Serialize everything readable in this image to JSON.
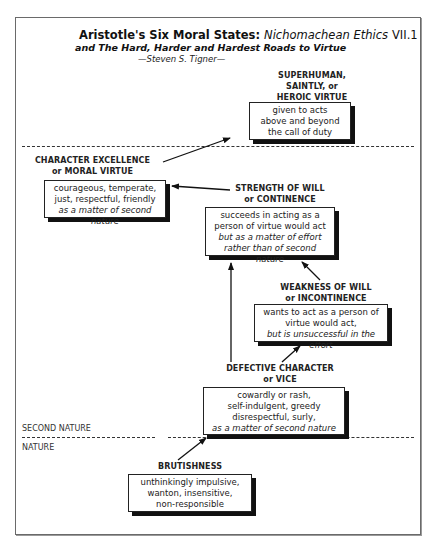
{
  "header": {
    "title_bold": "Aristotle's Six Moral States:",
    "title_italic": "Nichomachean Ethics",
    "title_ref": "VII.1",
    "subtitle": "and The Hard, Harder and Hardest Roads to Virtue",
    "author": "—Steven S. Tigner—"
  },
  "zones": {
    "second_nature": "SECOND NATURE",
    "nature": "NATURE"
  },
  "states": {
    "superhuman": {
      "label_lines": [
        "SUPERHUMAN,",
        "SAINTLY, or",
        "HEROIC VIRTUE"
      ],
      "desc_lines": [
        "given to acts",
        "above and beyond",
        "the call of duty"
      ],
      "desc_italic": ""
    },
    "moral_virtue": {
      "label_lines": [
        "CHARACTER EXCELLENCE",
        "or MORAL VIRTUE"
      ],
      "desc_lines": [
        "courageous, temperate,",
        "just, respectful, friendly"
      ],
      "desc_italic": "as a matter of second nature"
    },
    "continence": {
      "label_lines": [
        "STRENGTH OF WILL",
        "or CONTINENCE"
      ],
      "desc_lines": [
        "succeeds in acting as a",
        "person of virtue would act"
      ],
      "desc_italic_lines": [
        "but as a matter of effort",
        "rather than of second nature"
      ]
    },
    "incontinence": {
      "label_lines": [
        "WEAKNESS OF WILL",
        "or INCONTINENCE"
      ],
      "desc_lines": [
        "wants to act as a person of",
        "virtue would act,"
      ],
      "desc_italic": "but is unsuccessful in the effort"
    },
    "vice": {
      "label_lines": [
        "DEFECTIVE CHARACTER",
        "or VICE"
      ],
      "desc_lines": [
        "cowardly or rash,",
        "self-indulgent, greedy",
        "disrespectful, surly,"
      ],
      "desc_italic": "as a matter of second nature"
    },
    "brutishness": {
      "label_lines": [
        "BRUTISHNESS"
      ],
      "desc_lines": [
        "unthinkingly impulsive,",
        "wanton, insensitive,",
        "non-responsible"
      ],
      "desc_italic": ""
    }
  },
  "arrows": [
    {
      "from": "brutishness",
      "to": "vice"
    },
    {
      "from": "vice",
      "to": "incontinence"
    },
    {
      "from": "vice",
      "to": "continence"
    },
    {
      "from": "incontinence",
      "to": "continence"
    },
    {
      "from": "continence",
      "to": "moral_virtue"
    },
    {
      "from": "moral_virtue",
      "to": "superhuman"
    }
  ],
  "colors": {
    "ink": "#222222",
    "shadow": "#111111",
    "page_border": "#6a6a6a"
  }
}
